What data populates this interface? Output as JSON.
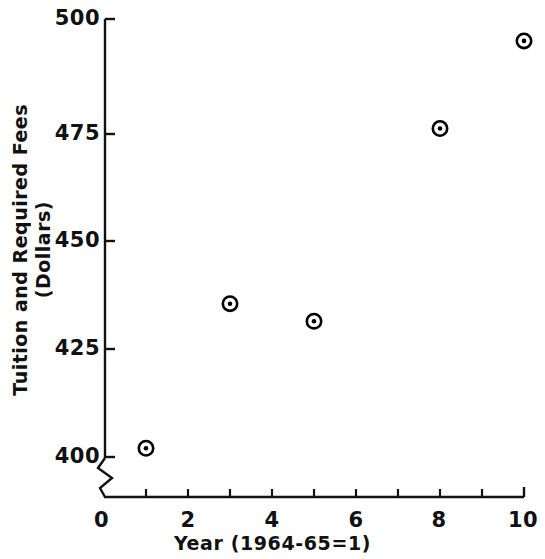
{
  "chart_data": {
    "type": "scatter",
    "title": "",
    "xlabel": "Year (1964-65=1)",
    "ylabel": "Tuition and Required Fees (Dollars)",
    "ylabel_lines": [
      "Tuition  and  Required  Fees",
      "(Dollars)"
    ],
    "x": [
      1,
      3,
      5,
      8,
      10
    ],
    "values": [
      402,
      435,
      431,
      475,
      495
    ],
    "series": [
      {
        "name": "Tuition and Required Fees",
        "points": [
          {
            "x": 1,
            "y": 402
          },
          {
            "x": 3,
            "y": 435
          },
          {
            "x": 5,
            "y": 431
          },
          {
            "x": 8,
            "y": 475
          },
          {
            "x": 10,
            "y": 495
          }
        ]
      }
    ],
    "xlim": [
      0,
      10
    ],
    "ylim": [
      400,
      500
    ],
    "y_axis_break": true,
    "y_axis_break_note": "zigzag break between 0 and 400",
    "xticks": [
      0,
      1,
      2,
      3,
      4,
      5,
      6,
      7,
      8,
      9,
      10
    ],
    "xtick_labels": [
      "0",
      "2",
      "4",
      "6",
      "8",
      "10"
    ],
    "xtick_label_values": [
      0,
      2,
      4,
      6,
      8,
      10
    ],
    "yticks": [
      400,
      425,
      450,
      475,
      500
    ],
    "ytick_labels": [
      "400",
      "425",
      "450",
      "475",
      "500"
    ],
    "grid": false,
    "legend": null,
    "marker": "circle-with-center-dot",
    "color": "#000000",
    "origin_label": "0"
  }
}
